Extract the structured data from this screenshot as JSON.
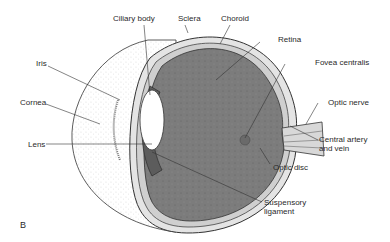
{
  "figure": {
    "panel_letter": "B"
  },
  "labels": {
    "ciliary_body": "Ciliary body",
    "sclera": "Sclera",
    "choroid": "Choroid",
    "retina": "Retina",
    "fovea_centralis": "Fovea centralis",
    "optic_nerve": "Optic nerve",
    "central_artery_1": "Central artery",
    "central_artery_2": "and vein",
    "optic_disc": "Optic disc",
    "suspensory_1": "Suspensory",
    "suspensory_2": "ligament",
    "iris": "Iris",
    "cornea": "Cornea",
    "lens": "Lens"
  },
  "colors": {
    "vitreous": "#7a7a7a",
    "line": "#333333",
    "sclera_fill": "#e6e6e6",
    "cornea_fill": "#f4f4f4"
  }
}
